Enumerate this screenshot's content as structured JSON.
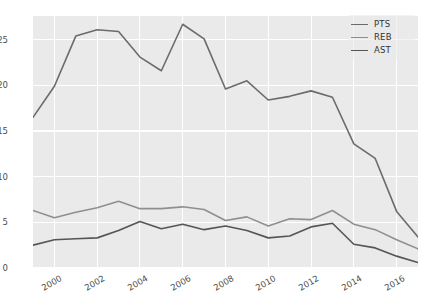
{
  "chart_data": {
    "type": "line",
    "title": "",
    "xlabel": "",
    "ylabel": "",
    "xlim": [
      1999,
      2017
    ],
    "ylim": [
      0,
      27.6
    ],
    "grid": true,
    "legend_position": "upper right",
    "background_color": "#eaeaea",
    "gridline_color": "#ffffff",
    "x": [
      1999,
      2000,
      2001,
      2002,
      2003,
      2004,
      2005,
      2006,
      2007,
      2008,
      2009,
      2010,
      2011,
      2012,
      2013,
      2014,
      2015,
      2016,
      2017
    ],
    "xticks": [
      2000,
      2002,
      2004,
      2006,
      2008,
      2010,
      2012,
      2014,
      2016
    ],
    "xtick_labels": [
      "2000",
      "2002",
      "2004",
      "2006",
      "2008",
      "2010",
      "2012",
      "2014",
      "2016"
    ],
    "yticks": [
      0,
      5,
      10,
      15,
      20,
      25
    ],
    "ytick_labels": [
      "0",
      "5",
      "10",
      "15",
      "20",
      "25"
    ],
    "series": [
      {
        "name": "PTS",
        "color": "#6b6b6b",
        "values": [
          16.5,
          19.9,
          25.4,
          26.1,
          25.9,
          23.1,
          21.6,
          26.7,
          25.1,
          19.6,
          20.5,
          18.4,
          18.8,
          19.4,
          18.7,
          13.6,
          12.0,
          6.2,
          3.4
        ]
      },
      {
        "name": "REB",
        "color": "#8f8f8f",
        "values": [
          6.3,
          5.5,
          6.1,
          6.6,
          7.3,
          6.5,
          6.5,
          6.7,
          6.4,
          5.2,
          5.6,
          4.6,
          5.4,
          5.3,
          6.3,
          4.8,
          4.2,
          3.1,
          2.1
        ]
      },
      {
        "name": "AST",
        "color": "#555555",
        "values": [
          2.5,
          3.1,
          3.2,
          3.3,
          4.1,
          5.1,
          4.3,
          4.8,
          4.2,
          4.6,
          4.1,
          3.3,
          3.5,
          4.5,
          4.9,
          2.6,
          2.2,
          1.3,
          0.6
        ]
      }
    ]
  },
  "legend": {
    "entries": [
      {
        "label": "PTS"
      },
      {
        "label": "REB"
      },
      {
        "label": "AST"
      }
    ]
  }
}
